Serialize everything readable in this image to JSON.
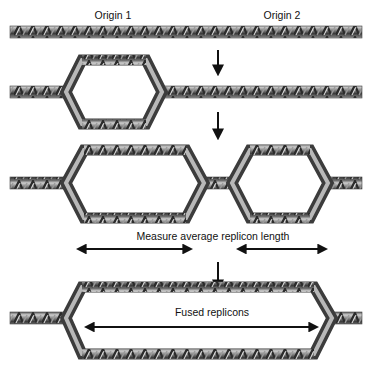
{
  "labels": {
    "origin1": "Origin 1",
    "origin2": "Origin 2",
    "measure": "Measure average replicon length",
    "fused": "Fused replicons"
  },
  "stages": [
    {
      "name": "unreplicated DNA",
      "bubbles": 0
    },
    {
      "name": "replication bubble at origin 1",
      "bubbles": 1
    },
    {
      "name": "replication bubbles at origins 1 and 2",
      "bubbles": 2
    },
    {
      "name": "fused replicons",
      "bubbles": 1
    }
  ],
  "colors": {
    "dna_dark": "#3a3a3a",
    "dna_mid": "#7a7a7a",
    "dna_light": "#d8d8d8",
    "arrow": "#111111",
    "background": "#ffffff"
  }
}
